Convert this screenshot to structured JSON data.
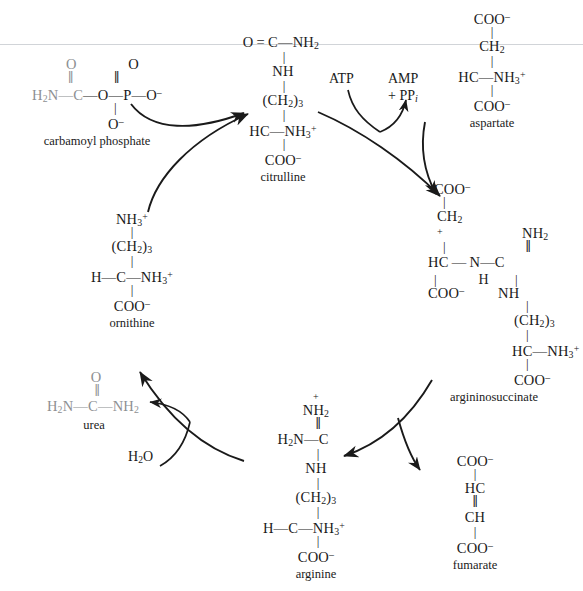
{
  "figure": {
    "background_color": "#ffffff",
    "ink_color": "#1a1a1a",
    "highlight_color": "#8d8f92"
  },
  "molecules": {
    "carbamoyl_phosphate": {
      "name": "carbamoyl phosphate",
      "top_left": "O",
      "top_right": "O",
      "backbone": "H2N — C — O — P — O⁻",
      "bottom": "O⁻",
      "atoms": {
        "amine": "H",
        "amine_sub": "2",
        "amine_tail": "N",
        "carbonyl_c": "C",
        "ester_o": "O",
        "phosphorus": "P",
        "terminal_o": "O",
        "terminal_charge": "–",
        "lower_o": "O",
        "lower_charge": "–",
        "carbonyl_o": "O",
        "phosphoryl_o": "O"
      }
    },
    "citrulline": {
      "name": "citrulline",
      "rows": [
        "O = C — NH2",
        "NH",
        "(CH2)3",
        "HC — NH3+",
        "COO–"
      ],
      "atoms": {
        "ureido_o": "O",
        "ureido_c": "C",
        "ureido_n": "NH",
        "ureido_n_sub": "2",
        "nh": "NH",
        "chain": "(CH",
        "chain_sub": "2",
        "chain_close": ")",
        "chain_count": "3",
        "alpha": "HC",
        "alpha_amine": "NH",
        "alpha_amine_sub": "3",
        "alpha_amine_charge": "+",
        "carboxyl": "COO",
        "carboxyl_charge": "–"
      }
    },
    "aspartate": {
      "name": "aspartate",
      "rows": [
        "COO–",
        "CH2",
        "HC — NH3+",
        "COO–"
      ],
      "atoms": {
        "top_carboxyl": "COO",
        "top_charge": "–",
        "methylene": "CH",
        "methylene_sub": "2",
        "alpha": "HC",
        "amine": "NH",
        "amine_sub": "3",
        "amine_charge": "+",
        "bottom_carboxyl": "COO",
        "bottom_charge": "–"
      }
    },
    "argininosuccinate": {
      "name": "argininosuccinate",
      "left_branch": [
        "COO–",
        "CH2",
        "HC",
        "COO–"
      ],
      "right_branch": [
        "+NH2",
        "C",
        "NH",
        "(CH2)3",
        "HC — NH3+",
        "COO–"
      ],
      "bridge": "N–H",
      "atoms": {
        "top_carboxyl": "COO",
        "top_charge": "–",
        "methylene": "CH",
        "methylene_sub": "2",
        "alpha": "HC",
        "bottom_carboxyl": "COO",
        "bottom_charge": "–",
        "bridge_n": "N",
        "bridge_h": "H",
        "guanidino_c": "C",
        "imino_n": "NH",
        "imino_sub": "2",
        "imino_charge": "+",
        "amide_n": "NH",
        "chain": "(CH",
        "chain_sub": "2",
        "chain_close": ")",
        "chain_count": "3",
        "chain_alpha": "HC",
        "chain_amine": "NH",
        "chain_amine_sub": "3",
        "chain_amine_charge": "+",
        "chain_carboxyl": "COO",
        "chain_carboxyl_charge": "–"
      }
    },
    "arginine": {
      "name": "arginine",
      "rows": [
        "+NH2",
        "H2N — C",
        "NH",
        "(CH2)3",
        "H — C — NH3+",
        "COO–"
      ],
      "atoms": {
        "imino_n": "NH",
        "imino_sub": "2",
        "imino_charge": "+",
        "amine": "H",
        "amine_sub": "2",
        "amine_tail": "N",
        "guanidino_c": "C",
        "amide_n": "NH",
        "chain": "(CH",
        "chain_sub": "2",
        "chain_close": ")",
        "chain_count": "3",
        "alpha_h": "H",
        "alpha_c": "C",
        "alpha_amine": "NH",
        "alpha_amine_sub": "3",
        "alpha_amine_charge": "+",
        "carboxyl": "COO",
        "carboxyl_charge": "–"
      }
    },
    "ornithine": {
      "name": "ornithine",
      "rows": [
        "NH3+",
        "(CH2)3",
        "H — C — NH3+",
        "COO–"
      ],
      "atoms": {
        "delta_amine": "NH",
        "delta_sub": "3",
        "delta_charge": "+",
        "chain": "(CH",
        "chain_sub": "2",
        "chain_close": ")",
        "chain_count": "3",
        "alpha_h": "H",
        "alpha_c": "C",
        "alpha_amine": "NH",
        "alpha_amine_sub": "3",
        "alpha_amine_charge": "+",
        "carboxyl": "COO",
        "carboxyl_charge": "–"
      }
    },
    "urea": {
      "name": "urea",
      "top": "O",
      "backbone": "H2N — C — NH2",
      "atoms": {
        "left_amine": "H",
        "left_sub": "2",
        "left_tail": "N",
        "carbonyl_c": "C",
        "carbonyl_o": "O",
        "right_amine": "NH",
        "right_sub": "2"
      }
    },
    "fumarate": {
      "name": "fumarate",
      "rows": [
        "COO–",
        "HC",
        "CH",
        "COO–"
      ],
      "atoms": {
        "top_carboxyl": "COO",
        "top_charge": "–",
        "alkene_top": "HC",
        "alkene_bottom": "CH",
        "bottom_carboxyl": "COO",
        "bottom_charge": "–"
      }
    }
  },
  "cofactors": {
    "atp": {
      "label": "ATP"
    },
    "amp": {
      "line1": "AMP",
      "line2_prefix": "+ PP",
      "line2_sub": "i"
    },
    "water": {
      "prefix": "H",
      "sub": "2",
      "suffix": "O"
    }
  },
  "bonds": {
    "single": "—",
    "double": "=",
    "vertical_single": "|",
    "vertical_double": "||"
  }
}
